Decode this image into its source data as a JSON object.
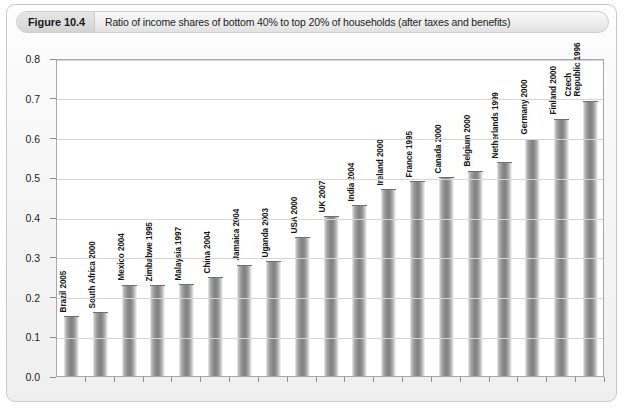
{
  "figure": {
    "tag": "Figure 10.4",
    "caption": "Ratio of income shares of bottom 40% to top 20% of households (after taxes and benefits)"
  },
  "chart_data": {
    "type": "bar",
    "title": "Ratio of income shares of bottom 40% to top 20% of households (after taxes and benefits)",
    "xlabel": "",
    "ylabel": "",
    "ylim": [
      0.0,
      0.8
    ],
    "ytick_labels": [
      "0.0",
      "0.1",
      "0.2",
      "0.3",
      "0.4",
      "0.5",
      "0.6",
      "0.7",
      "0.8"
    ],
    "ytick_values": [
      0.0,
      0.1,
      0.2,
      0.3,
      0.4,
      0.5,
      0.6,
      0.7,
      0.8
    ],
    "grid": true,
    "legend": false,
    "orientation": "vertical",
    "bar_label_rotation": -90,
    "categories": [
      "Brazil 2005",
      "South Africa 2000",
      "Mexico 2004",
      "Zimbabwe 1995",
      "Malaysia 1997",
      "China 2004",
      "Jamaica 2004",
      "Uganda 2003",
      "USA 2000",
      "UK 2007",
      "India 2004",
      "Ireland 2000",
      "France 1995",
      "Canada 2000",
      "Belgium 2000",
      "Netherlands 1999",
      "Germany 2000",
      "Finland 2000",
      "Czech Republic 1996"
    ],
    "values": [
      0.148,
      0.158,
      0.227,
      0.226,
      0.228,
      0.246,
      0.278,
      0.286,
      0.347,
      0.399,
      0.427,
      0.468,
      0.487,
      0.497,
      0.514,
      0.535,
      0.595,
      0.645,
      0.69
    ]
  },
  "colors": {
    "bar_mid": "#808080",
    "bar_edge": "#f2f2f2",
    "gridline": "#d6d6d6",
    "axis": "#a8a8a8",
    "card_border": "#c9c9c9",
    "caption_bg": "#ededed",
    "tag_bg": "#dcdcdc",
    "text": "#1a1a1a",
    "plot_bg": "#ffffff"
  }
}
